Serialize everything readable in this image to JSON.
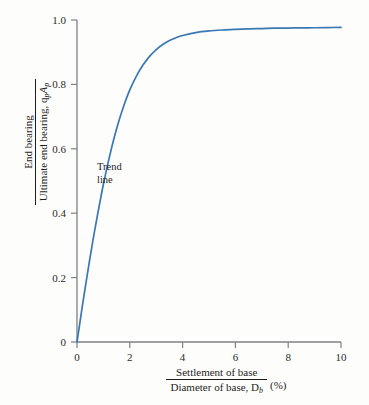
{
  "chart_data": {
    "type": "line",
    "title": "",
    "subtitle": "",
    "xlabel_numerator": "Settlement of base",
    "xlabel_denominator": "Diameter of base, D",
    "xlabel_denominator_sub": "b",
    "xlabel_unit": "(%)",
    "ylabel_numerator": "End bearing",
    "ylabel_denominator": "Ultimate end bearing, q",
    "ylabel_denominator_sub1": "p",
    "ylabel_denominator_mid": "A",
    "ylabel_denominator_sub2": "p",
    "xlim": [
      0,
      10
    ],
    "ylim": [
      0,
      1.0
    ],
    "xticks": [
      0,
      2,
      4,
      6,
      8,
      10
    ],
    "xtick_labels": [
      "0",
      "2",
      "4",
      "6",
      "8",
      "10"
    ],
    "yticks": [
      0,
      0.2,
      0.4,
      0.6,
      0.8,
      1.0
    ],
    "ytick_labels": [
      "0",
      "0.2",
      "0.4",
      "0.6",
      "0.8",
      "1.0"
    ],
    "grid": false,
    "legend": "none",
    "series": [
      {
        "name": "Trend line",
        "color": "#3a77b5",
        "x": [
          0,
          0.1,
          0.2,
          0.3,
          0.4,
          0.5,
          0.6,
          0.7,
          0.8,
          0.9,
          1.0,
          1.2,
          1.4,
          1.6,
          1.8,
          2.0,
          2.25,
          2.5,
          2.75,
          3.0,
          3.25,
          3.5,
          3.75,
          4.0,
          4.5,
          5.0,
          5.5,
          6.0,
          6.5,
          7.0,
          7.5,
          8.0,
          8.5,
          9.0,
          9.5,
          10.0
        ],
        "y": [
          0.0,
          0.055,
          0.11,
          0.163,
          0.215,
          0.265,
          0.314,
          0.36,
          0.405,
          0.448,
          0.49,
          0.565,
          0.632,
          0.69,
          0.74,
          0.783,
          0.826,
          0.86,
          0.887,
          0.908,
          0.924,
          0.936,
          0.945,
          0.952,
          0.961,
          0.966,
          0.969,
          0.971,
          0.9725,
          0.9735,
          0.9745,
          0.975,
          0.9755,
          0.976,
          0.9765,
          0.977
        ]
      }
    ],
    "annotations": [
      {
        "name": "trend-line",
        "line1": "Trend",
        "line2": "line",
        "x_data": 1.85,
        "y_data": 0.545
      }
    ],
    "style": {
      "axis_color": "#7d8285",
      "text_color": "#1d1d1d",
      "background": "#fdfdfc",
      "curve_color": "#3a77b5"
    }
  }
}
